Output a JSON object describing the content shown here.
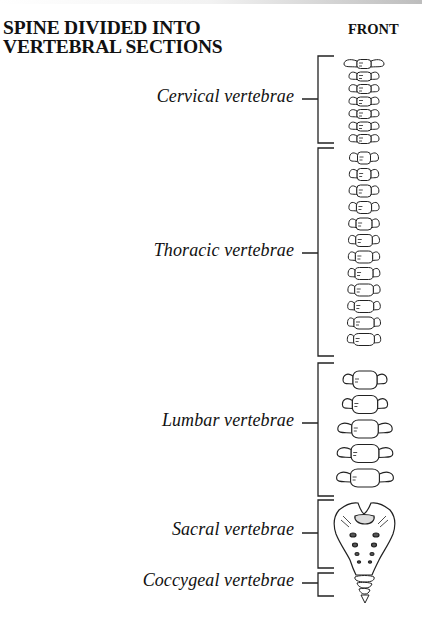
{
  "title": {
    "line1": "SPINE DIVIDED INTO",
    "line2": "VERTEBRAL SECTIONS"
  },
  "view_label": "FRONT",
  "sections": [
    {
      "name": "cervical",
      "label": "Cervical vertebrae",
      "bracket_top": 56,
      "bracket_bottom": 143,
      "tick_y": 99
    },
    {
      "name": "thoracic",
      "label": "Thoracic vertebrae",
      "bracket_top": 148,
      "bracket_bottom": 356,
      "tick_y": 253
    },
    {
      "name": "lumbar",
      "label": "Lumbar vertebrae",
      "bracket_top": 363,
      "bracket_bottom": 496,
      "tick_y": 423
    },
    {
      "name": "sacral",
      "label": "Sacral vertebrae",
      "bracket_top": 500,
      "bracket_bottom": 568,
      "tick_y": 533
    },
    {
      "name": "coccygeal",
      "label": "Coccygeal vertebrae",
      "bracket_top": 573,
      "bracket_bottom": 596,
      "tick_y": 583
    }
  ]
}
